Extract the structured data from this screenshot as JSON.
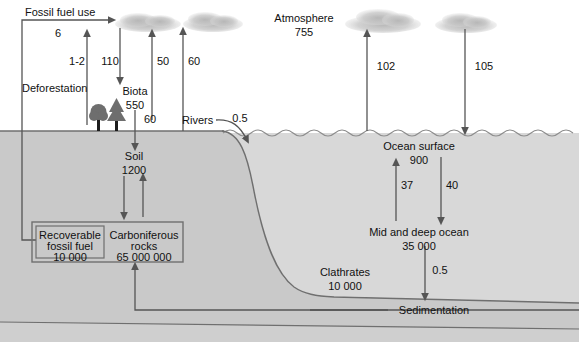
{
  "diagram": {
    "colors": {
      "sky": "#ffffff",
      "land": "#c9c9c9",
      "ocean": "#d8d8d8",
      "sediment": "#d2d2d2",
      "line": "#555555",
      "text": "#111111",
      "cloud": "#b8b8b8",
      "tree": "#6e6e6e"
    },
    "reservoirs": [
      {
        "id": "atmosphere",
        "name": "Atmosphere",
        "value": "755",
        "x": 304,
        "y": 14
      },
      {
        "id": "biota",
        "name": "Biota",
        "value": "550",
        "x": 137,
        "y": 89
      },
      {
        "id": "soil",
        "name": "Soil",
        "value": "1200",
        "x": 134,
        "y": 155
      },
      {
        "id": "fossil-fuel",
        "name": "Recoverable fossil fuel",
        "value": "10 000",
        "x": 71,
        "y": 232
      },
      {
        "id": "carb-rocks",
        "name": "Carboniferous rocks",
        "value": "65 000 000",
        "x": 144,
        "y": 232
      },
      {
        "id": "ocean-surface",
        "name": "Ocean surface",
        "value": "900",
        "x": 419,
        "y": 144
      },
      {
        "id": "deep-ocean",
        "name": "Mid and deep ocean",
        "value": "35 000",
        "x": 419,
        "y": 230
      },
      {
        "id": "clathrates",
        "name": "Clathrates",
        "value": "10 000",
        "x": 345,
        "y": 269
      }
    ],
    "flux_labels": [
      {
        "id": "fossil-fuel-use",
        "name": "Fossil fuel use",
        "value": "6",
        "x": 25,
        "y": 8
      },
      {
        "id": "deforestation",
        "name": "Deforestation",
        "value": "1-2",
        "x": 22,
        "y": 83
      },
      {
        "id": "rivers",
        "name": "Rivers",
        "value": "0.5",
        "x": 185,
        "y": 116
      },
      {
        "id": "sedimentation",
        "name": "Sedimentation",
        "value": "",
        "x": 395,
        "y": 304
      }
    ],
    "flux_values": [
      {
        "id": "flux-deforestation",
        "value": "1-2",
        "x": 72,
        "y": 55,
        "dir": "up",
        "ax": 87,
        "y1": 125,
        "y2": 33
      },
      {
        "id": "flux-photosynthesis",
        "value": "110",
        "x": 99,
        "y": 55,
        "dir": "down",
        "ax": 120,
        "y1": 28,
        "y2": 81
      },
      {
        "id": "flux-respiration",
        "value": "50",
        "x": 152,
        "y": 55,
        "dir": "up",
        "ax": 152,
        "y1": 120,
        "y2": 33
      },
      {
        "id": "flux-soil-resp",
        "value": "60",
        "x": 183,
        "y": 55,
        "dir": "up",
        "ax": 183,
        "y1": 131,
        "y2": 31
      },
      {
        "id": "flux-litter",
        "value": "60",
        "x": 146,
        "y": 113,
        "dir": "down",
        "ax": 135,
        "y1": 106,
        "y2": 146
      },
      {
        "id": "flux-ocean-out",
        "value": "102",
        "x": 375,
        "y": 60,
        "dir": "up",
        "ax": 367,
        "y1": 131,
        "y2": 33
      },
      {
        "id": "flux-ocean-in",
        "value": "105",
        "x": 472,
        "y": 60,
        "dir": "down",
        "ax": 465,
        "y1": 29,
        "y2": 131
      },
      {
        "id": "flux-upwelling",
        "value": "37",
        "x": 401,
        "y": 180,
        "dir": "up",
        "ax": 396,
        "y1": 220,
        "y2": 163
      },
      {
        "id": "flux-downwelling",
        "value": "40",
        "x": 446,
        "y": 180,
        "dir": "down",
        "ax": 441,
        "y1": 157,
        "y2": 220
      },
      {
        "id": "flux-burial",
        "value": "0.5",
        "x": 431,
        "y": 265,
        "dir": "down",
        "ax": 425,
        "y1": 244,
        "y2": 297
      },
      {
        "id": "flux-rivers",
        "value": "0.5",
        "x": 238,
        "y": 116,
        "dir": "curve",
        "ax": 0,
        "y1": 0,
        "y2": 0
      }
    ],
    "box": {
      "outer": {
        "x": 32,
        "y": 222,
        "w": 151,
        "h": 40
      },
      "inner": {
        "x": 36,
        "y": 226,
        "w": 68,
        "h": 32
      }
    }
  }
}
